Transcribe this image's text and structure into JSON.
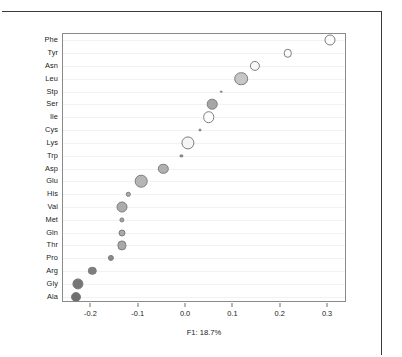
{
  "chart_data": {
    "type": "scatter",
    "title": "",
    "subtitle": "",
    "xlabel": "F1: 18.7%",
    "ylabel": "",
    "xlim": [
      -0.26,
      0.34
    ],
    "ylim": [
      0,
      22
    ],
    "grid": true,
    "legend": null,
    "xticks": [
      -0.2,
      -0.1,
      0.0,
      0.1,
      0.2,
      0.3
    ],
    "xticklabels": [
      "-0.2",
      "-0.1",
      "0.0",
      "0.1",
      "0.2",
      "0.3"
    ],
    "categories": [
      "Phe",
      "Tyr",
      "Asn",
      "Leu",
      "Stp",
      "Ser",
      "Ile",
      "Cys",
      "Lys",
      "Trp",
      "Asp",
      "Glu",
      "His",
      "Val",
      "Met",
      "Gln",
      "Thr",
      "Pro",
      "Arg",
      "Gly",
      "Ala"
    ],
    "yticklabels": [
      "Phe",
      "Tyr",
      "Asn",
      "Leu",
      "Stp",
      "Ser",
      "Ile",
      "Cys",
      "Lys",
      "Trp",
      "Asp",
      "Glu",
      "His",
      "Val",
      "Met",
      "Gln",
      "Thr",
      "Pro",
      "Arg",
      "Gly",
      "Ala"
    ],
    "points": [
      {
        "label": "Phe",
        "x": 0.305,
        "size": 11.0,
        "fill": "#fcfcfc"
      },
      {
        "label": "Tyr",
        "x": 0.215,
        "size": 8.4,
        "fill": "#fbfbfb"
      },
      {
        "label": "Asn",
        "x": 0.145,
        "size": 10.2,
        "fill": "#f7f7f7"
      },
      {
        "label": "Leu",
        "x": 0.116,
        "size": 13.6,
        "fill": "#c6c6c6"
      },
      {
        "label": "Stp",
        "x": 0.074,
        "size": 2.6,
        "fill": "#9a9a9a"
      },
      {
        "label": "Ser",
        "x": 0.055,
        "size": 10.6,
        "fill": "#a6a6a6"
      },
      {
        "label": "Ile",
        "x": 0.048,
        "size": 11.6,
        "fill": "#fdfdfd"
      },
      {
        "label": "Cys",
        "x": 0.03,
        "size": 3.0,
        "fill": "#9e9e9e"
      },
      {
        "label": "Lys",
        "x": 0.004,
        "size": 13.2,
        "fill": "#f5f5f5"
      },
      {
        "label": "Trp",
        "x": -0.01,
        "size": 3.2,
        "fill": "#8f8f8f"
      },
      {
        "label": "Asp",
        "x": -0.048,
        "size": 10.4,
        "fill": "#b0b0b0"
      },
      {
        "label": "Glu",
        "x": -0.095,
        "size": 12.6,
        "fill": "#b5b5b5"
      },
      {
        "label": "His",
        "x": -0.122,
        "size": 4.4,
        "fill": "#adadad"
      },
      {
        "label": "Val",
        "x": -0.135,
        "size": 11.0,
        "fill": "#acacac"
      },
      {
        "label": "Met",
        "x": -0.136,
        "size": 5.2,
        "fill": "#a5a5a5"
      },
      {
        "label": "Gln",
        "x": -0.136,
        "size": 7.0,
        "fill": "#a8a8a8"
      },
      {
        "label": "Thr",
        "x": -0.135,
        "size": 9.2,
        "fill": "#a9a9a9"
      },
      {
        "label": "Pro",
        "x": -0.158,
        "size": 6.2,
        "fill": "#8a8a8a"
      },
      {
        "label": "Arg",
        "x": -0.198,
        "size": 8.4,
        "fill": "#7f7f7f"
      },
      {
        "label": "Gly",
        "x": -0.228,
        "size": 11.2,
        "fill": "#767676"
      },
      {
        "label": "Ala",
        "x": -0.232,
        "size": 10.0,
        "fill": "#6f6f6f"
      }
    ]
  },
  "colors": {
    "panel_border": "#8a8a8a",
    "outer_frame": "#3b3b3b",
    "gridline": "#f2f2f2",
    "bubble_stroke": "#7d7d7d",
    "text": "#1a1a1a"
  }
}
